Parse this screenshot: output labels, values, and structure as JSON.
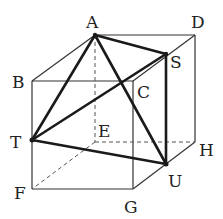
{
  "diagram": {
    "type": "cube-with-tetrahedron",
    "colors": {
      "edge": "#333333",
      "bold": "#1a1a1a",
      "hidden": "#555555",
      "label": "#222222"
    },
    "vertices": {
      "A": {
        "label": "A",
        "x": 95,
        "y": 35,
        "lx": 86,
        "ly": 28
      },
      "D": {
        "label": "D",
        "x": 195,
        "y": 35,
        "lx": 191,
        "ly": 28
      },
      "B": {
        "label": "B",
        "x": 32,
        "y": 81,
        "lx": 12,
        "ly": 88
      },
      "C": {
        "label": "C",
        "x": 133,
        "y": 81,
        "lx": 137,
        "ly": 98
      },
      "S": {
        "label": "S",
        "x": 166,
        "y": 54,
        "lx": 170,
        "ly": 68
      },
      "T": {
        "label": "T",
        "x": 32,
        "y": 140,
        "lx": 12,
        "ly": 148
      },
      "E": {
        "label": "E",
        "x": 95,
        "y": 142,
        "lx": 98,
        "ly": 137
      },
      "H": {
        "label": "H",
        "x": 195,
        "y": 142,
        "lx": 199,
        "ly": 156
      },
      "U": {
        "label": "U",
        "x": 166,
        "y": 164,
        "lx": 168,
        "ly": 187
      },
      "F": {
        "label": "F",
        "x": 32,
        "y": 189,
        "lx": 14,
        "ly": 199
      },
      "G": {
        "label": "G",
        "x": 133,
        "y": 189,
        "lx": 124,
        "ly": 213
      }
    }
  }
}
